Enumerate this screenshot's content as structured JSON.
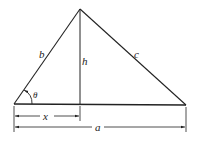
{
  "diagram": {
    "type": "triangle-with-altitude",
    "labels": {
      "side_left": "b",
      "side_right": "c",
      "altitude": "h",
      "angle": "θ",
      "segment_x": "x",
      "base": "a"
    },
    "colors": {
      "stroke": "#222222",
      "background": "#ffffff"
    }
  }
}
